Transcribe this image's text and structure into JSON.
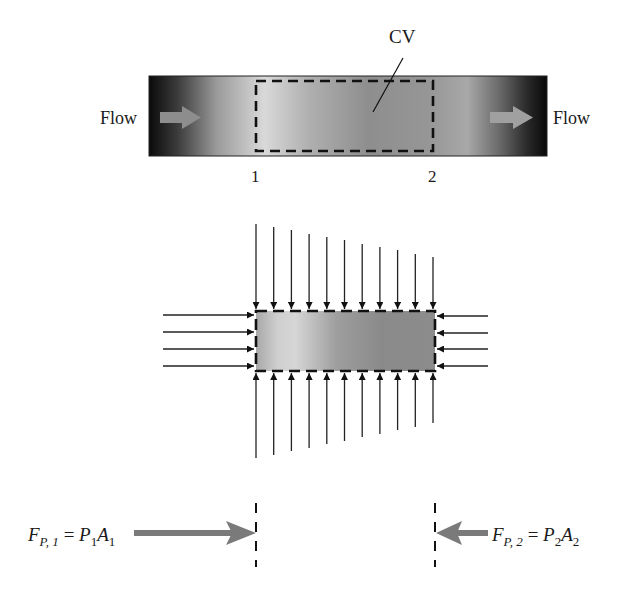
{
  "figure": {
    "top": {
      "cv_label": "CV",
      "flow_in_label": "Flow",
      "flow_out_label": "Flow",
      "section_1_label": "1",
      "section_2_label": "2"
    },
    "middle": {
      "top_arrow_count": 11,
      "bottom_arrow_count": 11,
      "left_arrow_count": 4,
      "right_arrow_count": 4
    },
    "bottom": {
      "left_force": {
        "F": "F",
        "F_sub": "P, 1",
        "eq": " = ",
        "P": "P",
        "P_sub": "1",
        "A": "A",
        "A_sub": "1"
      },
      "right_force": {
        "F": "F",
        "F_sub": "P, 2",
        "eq": " = ",
        "P": "P",
        "P_sub": "2",
        "A": "A",
        "A_sub": "2"
      }
    },
    "colors": {
      "arrow_gray": "#7a7a7a",
      "line_black": "#111111",
      "pipe_dark": "#0d0d0d",
      "pipe_light": "#d8d8d8",
      "pipe_mid": "#8f8f8f"
    }
  }
}
